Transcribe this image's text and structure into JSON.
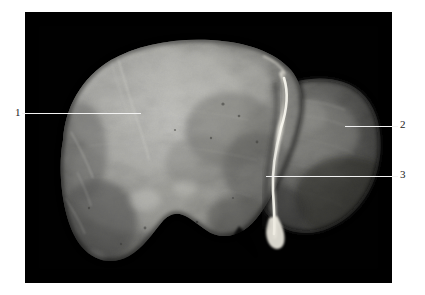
{
  "figure": {
    "kind": "anatomical-specimen-photograph",
    "plate_background_color": "#010101",
    "page_background_color": "#ffffff",
    "leader_line_color": "#f2f2f2",
    "label_text_color": "#222222"
  },
  "annotations": [
    {
      "id": "1",
      "label": "1",
      "label_x": 15,
      "label_y": 107,
      "line_x": 22,
      "line_y": 113,
      "line_width": 119,
      "points_to": "left-lobe-anterior-surface"
    },
    {
      "id": "2",
      "label": "2",
      "label_x": 400,
      "label_y": 119,
      "line_x": 345,
      "line_y": 126,
      "line_width": 53,
      "points_to": "right-posterior-lobe"
    },
    {
      "id": "3",
      "label": "3",
      "label_x": 400,
      "label_y": 169,
      "line_x": 266,
      "line_y": 176,
      "line_width": 132,
      "points_to": "falciform-ligament-ridge"
    }
  ],
  "plate": {
    "left": 25,
    "top": 12,
    "width": 367,
    "height": 271
  },
  "specimen_tones": {
    "highlight": "#d8d8d4",
    "midtone": "#9a9a96",
    "shadow": "#4a4a48",
    "deep_shadow": "#1d1d1c",
    "ligament_highlight": "#f4f2ea"
  }
}
